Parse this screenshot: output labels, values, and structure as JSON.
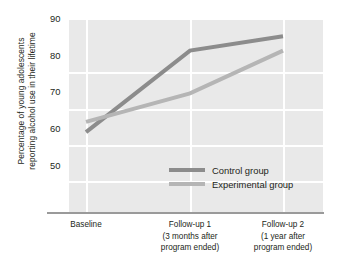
{
  "chart_data": {
    "type": "line",
    "title": "",
    "xlabel": "",
    "ylabel": "Percentage of young adolescents reporting alcohol use in their lifetime",
    "ylabel_lines": [
      "Percentage of young adolescents",
      "reporting alcohol use in their lifetime"
    ],
    "categories": [
      "Baseline",
      "Follow-up 1",
      "Follow-up 2"
    ],
    "category_labels": [
      [
        "Baseline"
      ],
      [
        "Follow-up 1",
        "(3 months after",
        "program ended)"
      ],
      [
        "Follow-up 2",
        "(1 year after",
        "program ended)"
      ]
    ],
    "yticks": [
      90,
      80,
      70,
      60,
      50
    ],
    "ytick_labels": [
      "90",
      "80",
      "70",
      "60",
      "50"
    ],
    "ylim": [
      50,
      90
    ],
    "grid": true,
    "legend_position": "inside-bottom-center",
    "series": [
      {
        "name": "Control group",
        "values": [
          62,
          82,
          85.5
        ],
        "color": "#8c8c8c"
      },
      {
        "name": "Experimental group",
        "values": [
          64.5,
          71.5,
          82
        ],
        "color": "#b5b5b5"
      }
    ]
  },
  "legend": {
    "items": [
      {
        "label": "Control group",
        "color": "#8c8c8c"
      },
      {
        "label": "Experimental group",
        "color": "#b5b5b5"
      }
    ]
  },
  "colors": {
    "plot_background": "#e9e9e9",
    "gridline": "#ffffff",
    "axis_line": "#9a9a9a",
    "text": "#231f20",
    "control": "#8c8c8c",
    "experimental": "#b5b5b5"
  }
}
